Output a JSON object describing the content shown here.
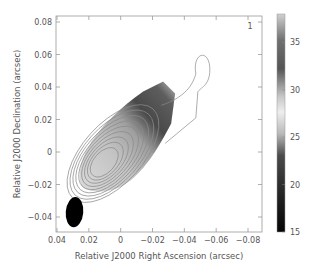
{
  "chart_data": {
    "type": "heatmap",
    "title": "",
    "panel_label": "1",
    "xlabel": "Relative J2000 Right Ascension (arcsec)",
    "ylabel": "Relative J2000 Declination (arcsec)",
    "xlim": [
      0.04,
      -0.085
    ],
    "ylim": [
      -0.05,
      0.083
    ],
    "x_ticks": [
      0.04,
      0.02,
      0,
      -0.02,
      -0.04,
      -0.06,
      -0.08
    ],
    "x_tick_labels": [
      "0.04",
      "0.02",
      "0",
      "−0.02",
      "−0.04",
      "−0.06",
      "−0.08"
    ],
    "y_ticks": [
      0.08,
      0.06,
      0.04,
      0.02,
      0,
      -0.02,
      -0.04
    ],
    "y_tick_labels": [
      "0.08",
      "0.06",
      "0.04",
      "0.02",
      "0",
      "−0.02",
      "−0.04"
    ],
    "grid": false,
    "colorbar": {
      "position": "right",
      "range": [
        15,
        38
      ],
      "ticks": [
        35,
        30,
        25,
        20,
        15
      ],
      "tick_labels": [
        "35",
        "30",
        "25",
        "20",
        "15"
      ],
      "colormap": "grayscale-inverted-bands"
    },
    "beam": {
      "x": 0.029,
      "y": -0.037,
      "major": 0.019,
      "minor": 0.011,
      "pa_deg": 5
    },
    "contours": {
      "center": [
        0.011,
        -0.007
      ],
      "levels": 9,
      "orientation_deg": 48,
      "extension": {
        "x": -0.051,
        "y": 0.053,
        "label": "outer lobe"
      }
    },
    "image_region": {
      "description": "spectral-index map clipped to emission",
      "value_gradient": [
        {
          "x": 0.012,
          "y": -0.008,
          "value": 28
        },
        {
          "x": 0.0,
          "y": 0.01,
          "value": 30
        },
        {
          "x": -0.012,
          "y": 0.02,
          "value": 29
        },
        {
          "x": -0.025,
          "y": 0.03,
          "value": 36
        },
        {
          "x": -0.033,
          "y": 0.04,
          "value": 34
        },
        {
          "x": -0.04,
          "y": 0.045,
          "value": 32
        }
      ]
    }
  }
}
